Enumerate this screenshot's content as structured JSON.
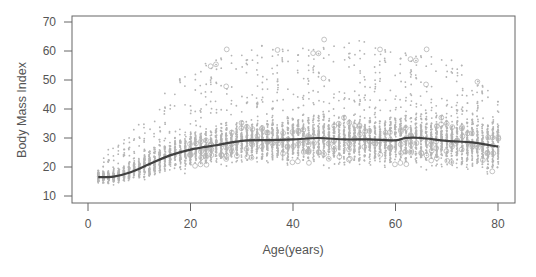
{
  "chart_data": {
    "type": "scatter",
    "title": "",
    "xlabel": "Age(years)",
    "ylabel": "Body Mass Index",
    "xlim": [
      0,
      82
    ],
    "ylim": [
      10,
      70
    ],
    "x_ticks": [
      0,
      20,
      40,
      60,
      80
    ],
    "y_ticks": [
      10,
      20,
      30,
      40,
      50,
      60,
      70
    ],
    "grid": false,
    "legend": null,
    "colors": {
      "points": "#b4b4b4",
      "curve": "#404040",
      "axis": "#666666",
      "text": "#555555"
    },
    "series": [
      {
        "name": "individual observations",
        "kind": "scatter",
        "description": "dense vertical strips of gray points, one per integer age 2-80",
        "spread_by_age": [
          {
            "age": 2,
            "low": 13,
            "high": 26
          },
          {
            "age": 5,
            "low": 13,
            "high": 27
          },
          {
            "age": 8,
            "low": 12,
            "high": 31
          },
          {
            "age": 12,
            "low": 13,
            "high": 40
          },
          {
            "age": 16,
            "low": 15,
            "high": 48
          },
          {
            "age": 20,
            "low": 16,
            "high": 55
          },
          {
            "age": 25,
            "low": 17,
            "high": 60
          },
          {
            "age": 30,
            "low": 17,
            "high": 62
          },
          {
            "age": 40,
            "low": 16,
            "high": 63
          },
          {
            "age": 50,
            "low": 15,
            "high": 65
          },
          {
            "age": 60,
            "low": 15,
            "high": 62
          },
          {
            "age": 70,
            "low": 14,
            "high": 60
          },
          {
            "age": 80,
            "low": 12,
            "high": 45
          }
        ]
      },
      {
        "name": "smoothed mean BMI",
        "kind": "line",
        "x": [
          2,
          5,
          8,
          12,
          16,
          20,
          25,
          30,
          35,
          40,
          45,
          50,
          55,
          60,
          62,
          65,
          70,
          75,
          80
        ],
        "y": [
          16.5,
          16.7,
          18,
          21,
          24,
          26,
          27.5,
          29,
          29.3,
          29.5,
          30,
          29.5,
          29.5,
          29.2,
          30,
          30,
          29,
          28.5,
          27
        ]
      }
    ]
  }
}
